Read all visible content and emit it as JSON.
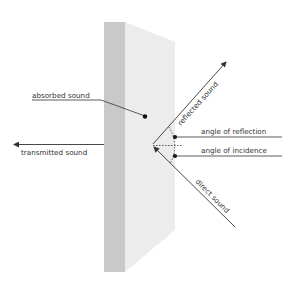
{
  "diagram": {
    "type": "sound-interaction-with-wall",
    "labels": {
      "absorbed": "absorbed sound",
      "transmitted": "transmitted sound",
      "reflected": "reflected sound",
      "angle_reflection": "angle of reflection",
      "angle_incidence": "angle of incidence",
      "direct": "direct sound"
    },
    "colors": {
      "panel_side": "#c9c9c9",
      "panel_front": "#ececec",
      "line": "#333333",
      "background": "#ffffff"
    }
  }
}
